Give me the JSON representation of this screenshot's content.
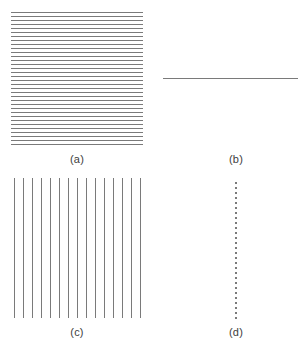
{
  "figure": {
    "width": 304,
    "height": 349,
    "background_color": "#ffffff",
    "stroke_color": "#7a7a7a",
    "caption_color": "#3d3d3d"
  },
  "panels": [
    {
      "id": "a",
      "caption": "(a)",
      "pattern": "horizontal-line-grating",
      "description": "Dense field of evenly spaced horizontal lines",
      "orientation": "horizontal",
      "line_count": 34,
      "period_px": 4,
      "line_width_px": 1,
      "bounds": {
        "x": 11,
        "y": 12,
        "width": 132,
        "height": 137
      },
      "color": "#7a7a7a"
    },
    {
      "id": "b",
      "caption": "(b)",
      "pattern": "single-horizontal-line",
      "description": "One isolated horizontal line",
      "orientation": "horizontal",
      "line_count": 1,
      "period_px": 0,
      "line_width_px": 1,
      "bounds": {
        "x": 163,
        "y": 78,
        "width": 135,
        "height": 1
      },
      "color": "#7a7a7a"
    },
    {
      "id": "c",
      "caption": "(c)",
      "pattern": "vertical-line-grating",
      "description": "Field of evenly spaced vertical lines",
      "orientation": "vertical",
      "line_count": 15,
      "period_px": 9,
      "line_width_px": 1,
      "bounds": {
        "x": 14,
        "y": 178,
        "width": 127,
        "height": 140
      },
      "color": "#7a7a7a"
    },
    {
      "id": "d",
      "caption": "(d)",
      "pattern": "dotted-vertical-line",
      "description": "One isolated vertical line rendered as a dotted column",
      "orientation": "vertical",
      "line_count": 1,
      "dot_count": 28,
      "dot_size_px": 2,
      "dot_gap_px": 3,
      "bounds": {
        "x": 235,
        "y": 182,
        "width": 2,
        "height": 139
      },
      "color": "#7a7a7a"
    }
  ],
  "chart_data": {
    "type": "table",
    "title": "",
    "xlabel": "",
    "ylabel": "",
    "categories": [
      "(a)",
      "(b)",
      "(c)",
      "(d)"
    ],
    "series": [
      {
        "name": "line_count",
        "values": [
          34,
          1,
          15,
          1
        ]
      },
      {
        "name": "period_px",
        "values": [
          4,
          0,
          9,
          0
        ]
      }
    ]
  }
}
